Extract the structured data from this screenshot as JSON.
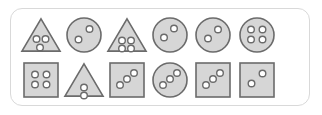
{
  "panel": {
    "name": "shape-dot-stimulus-panel",
    "border_color": "#d9d9d9",
    "background_color": "#ffffff",
    "corner_radius_px": 12,
    "rows": 2,
    "columns": 6
  },
  "style": {
    "shape_fill": "#d6d6d6",
    "shape_stroke": "#6b6b6b",
    "dot_fill": "#ffffff",
    "dot_stroke": "#6b6b6b"
  },
  "items": [
    {
      "id": "item-1",
      "row": 0,
      "col": 0,
      "shape": "triangle",
      "dot_count": 3,
      "dot_layout": "cluster-2-over-1",
      "dots": [
        [
          -4.5,
          -3.5
        ],
        [
          4.5,
          -3.5
        ],
        [
          -1.0,
          5.0
        ]
      ]
    },
    {
      "id": "item-2",
      "row": 0,
      "col": 1,
      "shape": "circle",
      "dot_count": 2,
      "dot_layout": "diagonal",
      "dots": [
        [
          5.5,
          -6.0
        ],
        [
          -5.5,
          4.5
        ]
      ]
    },
    {
      "id": "item-3",
      "row": 0,
      "col": 2,
      "shape": "triangle",
      "dot_count": 4,
      "dot_layout": "grid-2x2",
      "dots": [
        [
          -5.0,
          -2.0
        ],
        [
          4.0,
          -2.0
        ],
        [
          -5.0,
          6.0
        ],
        [
          4.0,
          6.0
        ]
      ]
    },
    {
      "id": "item-4",
      "row": 0,
      "col": 3,
      "shape": "circle",
      "dot_count": 2,
      "dot_layout": "diagonal",
      "dots": [
        [
          4.0,
          -6.5
        ],
        [
          -6.0,
          2.5
        ]
      ]
    },
    {
      "id": "item-5",
      "row": 0,
      "col": 4,
      "shape": "circle",
      "dot_count": 2,
      "dot_layout": "diagonal",
      "dots": [
        [
          5.0,
          -5.5
        ],
        [
          -5.0,
          3.5
        ]
      ]
    },
    {
      "id": "item-6",
      "row": 0,
      "col": 5,
      "shape": "circle",
      "dot_count": 4,
      "dot_layout": "grid-2x2",
      "dots": [
        [
          -6.0,
          -5.5
        ],
        [
          5.5,
          -5.5
        ],
        [
          -6.0,
          4.5
        ],
        [
          5.5,
          4.5
        ]
      ]
    },
    {
      "id": "item-7",
      "row": 1,
      "col": 0,
      "shape": "square",
      "dot_count": 4,
      "dot_layout": "grid-2x2",
      "dots": [
        [
          -6.0,
          -5.5
        ],
        [
          5.5,
          -5.5
        ],
        [
          -6.0,
          4.5
        ],
        [
          5.5,
          4.5
        ]
      ]
    },
    {
      "id": "item-8",
      "row": 1,
      "col": 1,
      "shape": "triangle",
      "dot_count": 2,
      "dot_layout": "vertical-stack",
      "dots": [
        [
          0.0,
          0.0
        ],
        [
          0.0,
          8.0
        ]
      ]
    },
    {
      "id": "item-9",
      "row": 1,
      "col": 2,
      "shape": "square",
      "dot_count": 3,
      "dot_layout": "diagonal",
      "dots": [
        [
          7.0,
          -7.0
        ],
        [
          0.0,
          -1.0
        ],
        [
          -7.0,
          5.0
        ]
      ]
    },
    {
      "id": "item-10",
      "row": 1,
      "col": 3,
      "shape": "circle",
      "dot_count": 3,
      "dot_layout": "diagonal",
      "dots": [
        [
          7.0,
          -7.0
        ],
        [
          0.0,
          -1.0
        ],
        [
          -7.0,
          5.0
        ]
      ]
    },
    {
      "id": "item-11",
      "row": 1,
      "col": 4,
      "shape": "square",
      "dot_count": 3,
      "dot_layout": "diagonal",
      "dots": [
        [
          7.0,
          -7.0
        ],
        [
          0.0,
          -1.0
        ],
        [
          -7.0,
          5.0
        ]
      ]
    },
    {
      "id": "item-12",
      "row": 1,
      "col": 5,
      "shape": "square",
      "dot_count": 2,
      "dot_layout": "diagonal",
      "dots": [
        [
          5.5,
          -6.5
        ],
        [
          -5.5,
          3.5
        ]
      ]
    }
  ],
  "layout": {
    "cell_width_px": 44,
    "cell_height_px": 42,
    "col_positions_px": [
      8,
      51,
      94,
      137,
      180,
      224
    ],
    "row_positions_px": [
      5,
      50
    ],
    "dot_radius_px": 3.3,
    "shape_size_px": 34
  }
}
